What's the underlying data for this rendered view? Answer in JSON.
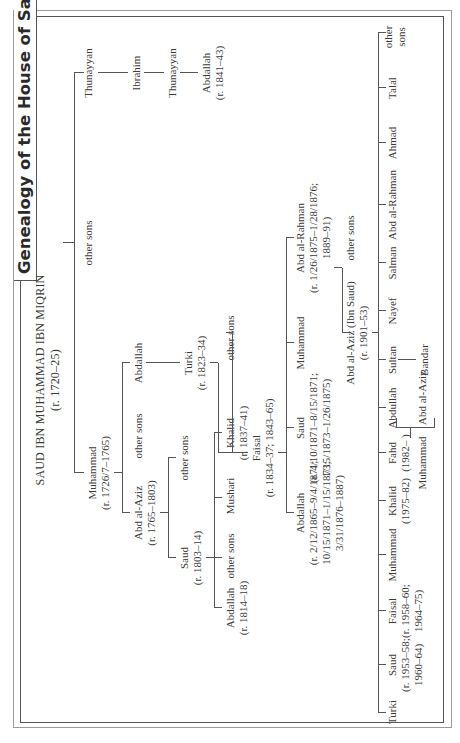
{
  "title": "Genealogy of the House of Saud",
  "root": {
    "name": "SAUD IBN MUHAMMAD IBN MIQRIN",
    "reign": "(r. 1720–25)"
  },
  "gen1": {
    "muhammad": {
      "name": "Muhammad",
      "reign": "(r. 1726/7–1765)"
    },
    "other_sons": "other sons",
    "thunayyan": "Thunayyan"
  },
  "gen2": {
    "abd_al_aziz": {
      "name": "Abd al-Aziz",
      "reign": "(r. 1765–1803)"
    },
    "other_sons": "other sons",
    "abdallah": "Abdallah",
    "ibrahim": "Ibrahim"
  },
  "gen3": {
    "saud": {
      "name": "Saud",
      "reign": "(r. 1803–14)"
    },
    "other_sons": "other sons",
    "turki": {
      "name": "Turki",
      "reign": "(r. 1823–34)"
    },
    "thunayyan": "Thunayyan"
  },
  "gen4": {
    "abdallah": {
      "name": "Abdallah",
      "reign": "(r. 1814–18)"
    },
    "other_sons": "other sons",
    "mushari": "Mushari",
    "khalid": {
      "name": "Khalid",
      "reign": "(r. 1837–41)"
    },
    "faisal": {
      "name": "Faisal",
      "reign": "(r. 1834–37; 1843–65)"
    },
    "other_sons_turki": "other sons",
    "abdallah_thunayyan": {
      "name": "Abdallah",
      "reign": "(r. 1841–43)"
    }
  },
  "gen5": {
    "abdallah": {
      "name": "Abdallah",
      "reign": [
        "(r. 2/12/1865–9/4/1871;",
        "10/15/1871–1/15/1873;",
        "3/31/1876–1887)"
      ]
    },
    "saud": {
      "name": "Saud",
      "reign": [
        "(r. 4/10/1871–8/15/1871;",
        "1/15/1873–1/26/1875)"
      ]
    },
    "muhammad": "Muhammad",
    "abd_al_rahman": {
      "name": "Abd al-Rahman",
      "reign": [
        "(r. 1/26/1875–1/28/1876;",
        "1889–91)"
      ]
    }
  },
  "gen6": {
    "abd_al_aziz": {
      "name": "Abd al-Aziz (Ibn Saud)",
      "reign": "(r. 1901–53)"
    },
    "other_sons": "other sons"
  },
  "gen7": [
    {
      "name": "Turki"
    },
    {
      "name": "Saud",
      "reign": [
        "(r. 1953–58;",
        "1960–64)"
      ]
    },
    {
      "name": "Faisal",
      "reign": [
        "(r. 1958–60;",
        "1964–75)"
      ]
    },
    {
      "name": "Muhammad"
    },
    {
      "name": "Khalid",
      "reign": [
        "(1975–82)"
      ]
    },
    {
      "name": "Fahd",
      "reign": [
        "(1982–  )"
      ]
    },
    {
      "name": "Abdullah"
    },
    {
      "name": "Sultan"
    },
    {
      "name": "Nayef"
    },
    {
      "name": "Salman"
    },
    {
      "name": "Abd al-Rahman"
    },
    {
      "name": "Ahmad"
    },
    {
      "name": "Talal"
    },
    {
      "name": "other",
      "line2": "sons"
    }
  ],
  "gen8": {
    "fahd_sons": [
      "Muhammad",
      "Abd al-Aziz"
    ],
    "sultan_son": "Bandar"
  }
}
